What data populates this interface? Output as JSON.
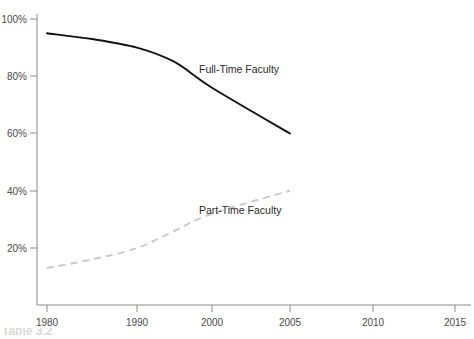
{
  "chart_data": {
    "type": "line",
    "title": "",
    "xlabel": "",
    "ylabel": "",
    "xlim": [
      1980,
      2015
    ],
    "ylim": [
      0,
      100
    ],
    "grid": false,
    "legend_position": "inline-annotation",
    "x_tick_labels": [
      "1980",
      "1990",
      "2000",
      "2005",
      "2010",
      "2015"
    ],
    "x_tick_values": [
      1980,
      1990,
      2000,
      2005,
      2010,
      2015
    ],
    "x_tick_pixels": [
      47,
      137,
      212,
      290,
      373,
      455
    ],
    "y_tick_labels": [
      "20%",
      "40%",
      "60%",
      "80%",
      "100%"
    ],
    "y_tick_values": [
      20,
      40,
      60,
      80,
      100
    ],
    "series": [
      {
        "name": "Full-Time Faculty",
        "style": "solid",
        "color": "#111111",
        "annotation": "Full-Time Faculty",
        "x": [
          1980,
          1985,
          1990,
          1995,
          2000,
          2005
        ],
        "values": [
          95,
          93,
          90,
          85,
          76,
          60
        ]
      },
      {
        "name": "Part-Time Faculty",
        "style": "dashed",
        "color": "#c8c8c8",
        "annotation": "Part-Time Faculty",
        "x": [
          1980,
          1985,
          1990,
          1995,
          2000,
          2005
        ],
        "values": [
          13,
          16,
          20,
          26,
          32,
          40
        ]
      }
    ]
  },
  "annotations": {
    "full_time_label": "Full-Time Faculty",
    "part_time_label": "Part-Time Faculty"
  },
  "caption": {
    "text": "Table 3.2"
  },
  "colors": {
    "solid_series": "#111111",
    "dashed_series": "#c8c8c8",
    "axis": "#8a8a8a",
    "tick_label": "#4a4a4a",
    "background": "#ffffff"
  }
}
